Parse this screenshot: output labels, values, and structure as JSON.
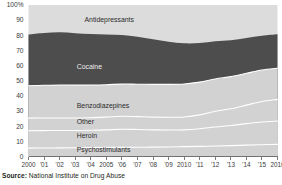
{
  "source": {
    "prefix": "Source:",
    "text": " National Institute on Drug Abuse"
  },
  "colors": {
    "antidepressants": "#dcdcdc",
    "cocaine": "#4d4d4d",
    "benzodiazepines": "#d2d2d2",
    "other": "#d2d2d2",
    "heroin": "#d2d2d2",
    "psychostimulants": "#d2d2d2",
    "separator": "#ffffff",
    "axis": "#5a5a5a",
    "text": "#231f20"
  },
  "chart_data": {
    "type": "area",
    "stacked": true,
    "percent": true,
    "title": "",
    "xlabel": "",
    "ylabel": "",
    "ylim": [
      0,
      100
    ],
    "ytick_labels": [
      "0",
      "10",
      "20",
      "30",
      "40",
      "50",
      "60",
      "70",
      "80",
      "90",
      "100%"
    ],
    "yticks": [
      0,
      10,
      20,
      30,
      40,
      50,
      60,
      70,
      80,
      90,
      100
    ],
    "grid": false,
    "legend_position": "inline-labels",
    "x": [
      2000,
      2001,
      2002,
      2003,
      2004,
      2005,
      2006,
      2007,
      2008,
      2009,
      2010,
      2011,
      2012,
      2013,
      2014,
      2015,
      2016
    ],
    "xtick_labels": [
      "2000",
      "'01",
      "'02",
      "'03",
      "'04",
      "2005",
      "'06",
      "'07",
      "'08",
      "'09",
      "2010",
      "'11",
      "'12",
      "'13",
      "'14",
      "'15",
      "2016"
    ],
    "series": [
      {
        "name": "Psychostimulants",
        "label": "Psychostimulants",
        "label_x": 2003.1,
        "label_y": 3.0,
        "on_dark": false,
        "values": [
          5.5,
          5.6,
          5.7,
          5.8,
          5.9,
          6.0,
          6.0,
          6.1,
          6.2,
          6.3,
          6.5,
          6.7,
          6.9,
          7.2,
          7.5,
          7.8,
          8.0
        ]
      },
      {
        "name": "Heroin",
        "label": "Heroin",
        "label_x": 2003.1,
        "label_y": 12.5,
        "on_dark": false,
        "values": [
          11.5,
          11.5,
          11.5,
          11.4,
          11.4,
          11.6,
          12.0,
          11.7,
          11.4,
          11.2,
          11.1,
          11.6,
          12.6,
          13.3,
          14.2,
          15.0,
          15.4
        ]
      },
      {
        "name": "Other",
        "label": "Other",
        "label_x": 2003.1,
        "label_y": 21.5,
        "on_dark": false,
        "values": [
          8.3,
          8.3,
          8.2,
          8.2,
          8.3,
          8.4,
          8.6,
          8.5,
          8.4,
          8.4,
          8.5,
          9.2,
          10.4,
          11.0,
          12.2,
          13.5,
          14.3
        ]
      },
      {
        "name": "Benzodiazepines",
        "label": "Benzodiazepines",
        "label_x": 2003.1,
        "label_y": 32.0,
        "on_dark": false,
        "values": [
          21.4,
          21.6,
          21.8,
          21.7,
          21.6,
          21.4,
          21.2,
          21.4,
          21.6,
          21.7,
          21.8,
          21.6,
          21.3,
          21.2,
          21.0,
          20.8,
          20.6
        ]
      },
      {
        "name": "Cocaine",
        "label": "Cocaine",
        "label_x": 2003.1,
        "label_y": 58.0,
        "on_dark": true,
        "values": [
          33.8,
          34.5,
          34.8,
          34.3,
          33.6,
          33.1,
          32.4,
          31.3,
          29.8,
          28.2,
          26.8,
          25.8,
          24.9,
          24.0,
          23.3,
          22.6,
          22.4
        ]
      },
      {
        "name": "Antidepressants",
        "label": "Antidepressants",
        "label_x": 2003.6,
        "label_y": 89.0,
        "on_dark": false,
        "values": [
          19.5,
          18.5,
          18.0,
          18.6,
          19.2,
          19.5,
          19.8,
          21.0,
          22.6,
          24.2,
          25.3,
          25.1,
          23.9,
          23.3,
          21.8,
          20.3,
          19.3
        ]
      }
    ]
  }
}
